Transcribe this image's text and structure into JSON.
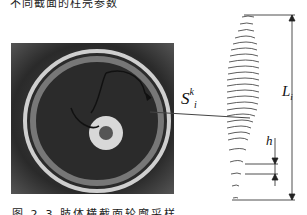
{
  "figure": {
    "top_caption": "不同截面的柱壳参数",
    "bottom_caption": "图 2-3  肢体横截面轮廓采样",
    "labels": {
      "section_area": "S",
      "section_area_sup": "k",
      "section_area_sub": "i",
      "length": "L",
      "length_sub": "i",
      "spacing": "h"
    },
    "panels": [
      {
        "name": "ct-cross-section",
        "description": "grayscale CT cross-section of limb with traced contour and arrow"
      },
      {
        "name": "stacked-contours",
        "description": "stacked contour slices with dimension arrows L_i and h"
      }
    ]
  }
}
